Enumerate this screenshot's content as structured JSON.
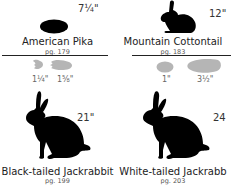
{
  "species": [
    {
      "name": "American Pika",
      "page": "pg. 179",
      "size": "7¼\"",
      "tracks": [
        "1¼\"",
        "1⅝\""
      ]
    },
    {
      "name": "Mountain Cottontail",
      "page": "pg. 183",
      "size": "12\"",
      "tracks": [
        "1\"",
        "3½\""
      ]
    },
    {
      "name": "Black-tailed Jackrabbit",
      "page": "pg. 199",
      "size": "21\""
    },
    {
      "name": "White-tailed Jackrabb",
      "page": "pg. 203",
      "size": "24"
    }
  ],
  "colors": {
    "silhouette": "#000000",
    "track": "#b5b5b5",
    "rule": "#222222"
  }
}
